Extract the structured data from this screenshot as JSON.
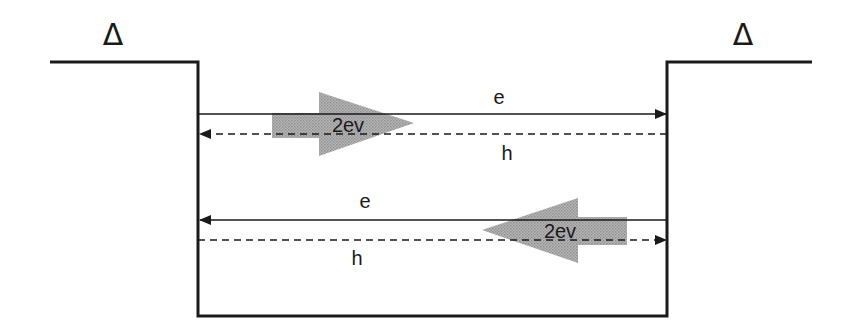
{
  "diagram": {
    "title": "",
    "colors": {
      "line": "#1a1a1a",
      "arrow_fill": "#a8a8a8",
      "background": "#ffffff"
    },
    "gap_labels": {
      "left": "Δ",
      "right": "Δ"
    },
    "top_pair": {
      "electron_label": "e",
      "electron_direction": "right",
      "hole_label": "h",
      "hole_direction": "left",
      "energy_label": "2ev",
      "energy_direction": "right"
    },
    "bottom_pair": {
      "electron_label": "e",
      "electron_direction": "left",
      "hole_label": "h",
      "hole_direction": "right",
      "energy_label": "2ev",
      "energy_direction": "left"
    }
  }
}
